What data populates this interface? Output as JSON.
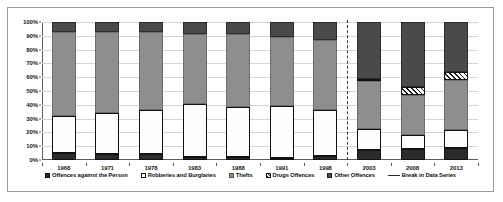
{
  "chart_data": {
    "type": "bar",
    "subtype": "stacked-percent",
    "title": "",
    "subtitle": "",
    "xlabel": "",
    "ylabel": "",
    "ylim": [
      0,
      100
    ],
    "ytick_labels": [
      "0%",
      "10%",
      "20%",
      "30%",
      "40%",
      "50%",
      "60%",
      "70%",
      "80%",
      "90%",
      "100%"
    ],
    "ytick_values": [
      0,
      10,
      20,
      30,
      40,
      50,
      60,
      70,
      80,
      90,
      100
    ],
    "grid": true,
    "legend_position": "bottom",
    "categories": [
      "1968",
      "1971",
      "1978",
      "1983",
      "1988",
      "1991",
      "1998",
      "2003",
      "2008",
      "2013"
    ],
    "series": [
      {
        "name": "Offences against the Person",
        "key": "person",
        "color": "#2b2b2b",
        "pattern": "solid-dark",
        "values": [
          5,
          4,
          4,
          2.5,
          2.5,
          1.5,
          3,
          7.5,
          8,
          9
        ]
      },
      {
        "name": "Robberies and Burglaries",
        "key": "robbery",
        "color": "#ffffff",
        "pattern": "solid-white",
        "values": [
          27,
          30,
          32,
          38,
          36,
          38,
          33.5,
          15,
          10,
          13
        ]
      },
      {
        "name": "Thefts",
        "key": "theft",
        "color": "#8e8e8e",
        "pattern": "solid-gray",
        "values": [
          61,
          59,
          57,
          51,
          53,
          50,
          50.5,
          34.5,
          29,
          36
        ]
      },
      {
        "name": "Drugs Offences",
        "key": "drugs",
        "color": "#ffffff",
        "pattern": "diagonal-hatch",
        "values": [
          0,
          0,
          0,
          0,
          0,
          0,
          0,
          2,
          6,
          6
        ]
      },
      {
        "name": "Other Offences",
        "key": "other",
        "color": "#4a4a4a",
        "pattern": "solid-darkgray",
        "values": [
          7,
          7,
          7,
          8.5,
          8.5,
          10.5,
          13,
          41,
          47,
          36
        ]
      }
    ],
    "annotations": [
      {
        "name": "Break in Data Series",
        "type": "vertical-dashed-line",
        "between": [
          "1998",
          "2003"
        ]
      }
    ]
  },
  "legend": {
    "items": [
      {
        "label": "Offences against the Person",
        "swatch": "solid-dark-swatch"
      },
      {
        "label": "Robberies and Burglaries",
        "swatch": "solid-white-swatch"
      },
      {
        "label": "Thefts",
        "swatch": "solid-gray-swatch"
      },
      {
        "label": "Drugs Offences",
        "swatch": "hatched-swatch"
      },
      {
        "label": "Other Offences",
        "swatch": "solid-darkgray-swatch"
      },
      {
        "label": "Break in Data Series",
        "swatch": "dashed-line-swatch"
      }
    ]
  }
}
